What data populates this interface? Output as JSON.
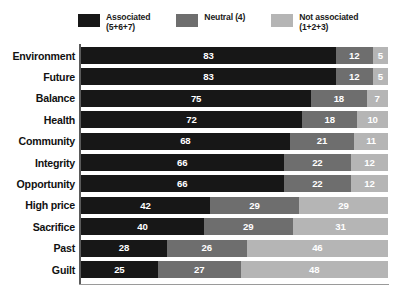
{
  "legend": {
    "items": [
      {
        "label_line1": "Associated",
        "label_line2": "(5+6+7)",
        "color": "#171717",
        "swatch_name": "legend-swatch-associated"
      },
      {
        "label_line1": "Neutral (4)",
        "label_line2": "",
        "color": "#6e6e6e",
        "swatch_name": "legend-swatch-neutral"
      },
      {
        "label_line1": "Not associated",
        "label_line2": "(1+2+3)",
        "color": "#b5b5b5",
        "swatch_name": "legend-swatch-not-associated"
      }
    ]
  },
  "chart_data": {
    "type": "bar",
    "subtype": "stacked-horizontal-100",
    "title": "",
    "xlabel": "",
    "ylabel": "",
    "xlim": [
      0,
      100
    ],
    "grid": false,
    "legend_position": "top",
    "categories": [
      "Environment",
      "Future",
      "Balance",
      "Health",
      "Community",
      "Integrity",
      "Opportunity",
      "High price",
      "Sacrifice",
      "Past",
      "Guilt"
    ],
    "series": [
      {
        "name": "Associated (5+6+7)",
        "color": "#171717",
        "values": [
          83,
          83,
          75,
          72,
          68,
          66,
          66,
          42,
          40,
          28,
          25
        ]
      },
      {
        "name": "Neutral (4)",
        "color": "#6e6e6e",
        "values": [
          12,
          12,
          18,
          18,
          21,
          22,
          22,
          29,
          29,
          26,
          27
        ]
      },
      {
        "name": "Not associated (1+2+3)",
        "color": "#b5b5b5",
        "values": [
          5,
          5,
          7,
          10,
          11,
          12,
          12,
          29,
          31,
          46,
          48
        ]
      }
    ]
  }
}
